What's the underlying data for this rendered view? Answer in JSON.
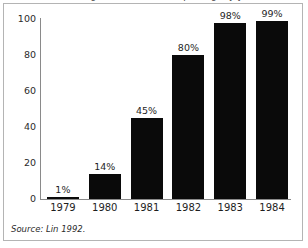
{
  "figure": {
    "title_clipped": "Percentage of households reporting, by year",
    "source_note": "Source: Lin 1992."
  },
  "chart_data": {
    "type": "bar",
    "title": "",
    "xlabel": "",
    "ylabel": "",
    "categories": [
      "1979",
      "1980",
      "1981",
      "1982",
      "1983",
      "1984"
    ],
    "values": [
      1,
      14,
      45,
      80,
      98,
      99
    ],
    "data_labels": [
      "1%",
      "14%",
      "45%",
      "80%",
      "98%",
      "99%"
    ],
    "ylim": [
      0,
      100
    ],
    "yticks": [
      0,
      20,
      40,
      60,
      80,
      100
    ],
    "ytick_labels": [
      "0",
      "20",
      "40",
      "60",
      "80",
      "100"
    ],
    "grid": false,
    "legend": false,
    "bar_color": "#0a0a0a",
    "axis_color": "#8a8a8a",
    "text_color": "#1e1e1e",
    "background": "#ffffff"
  }
}
